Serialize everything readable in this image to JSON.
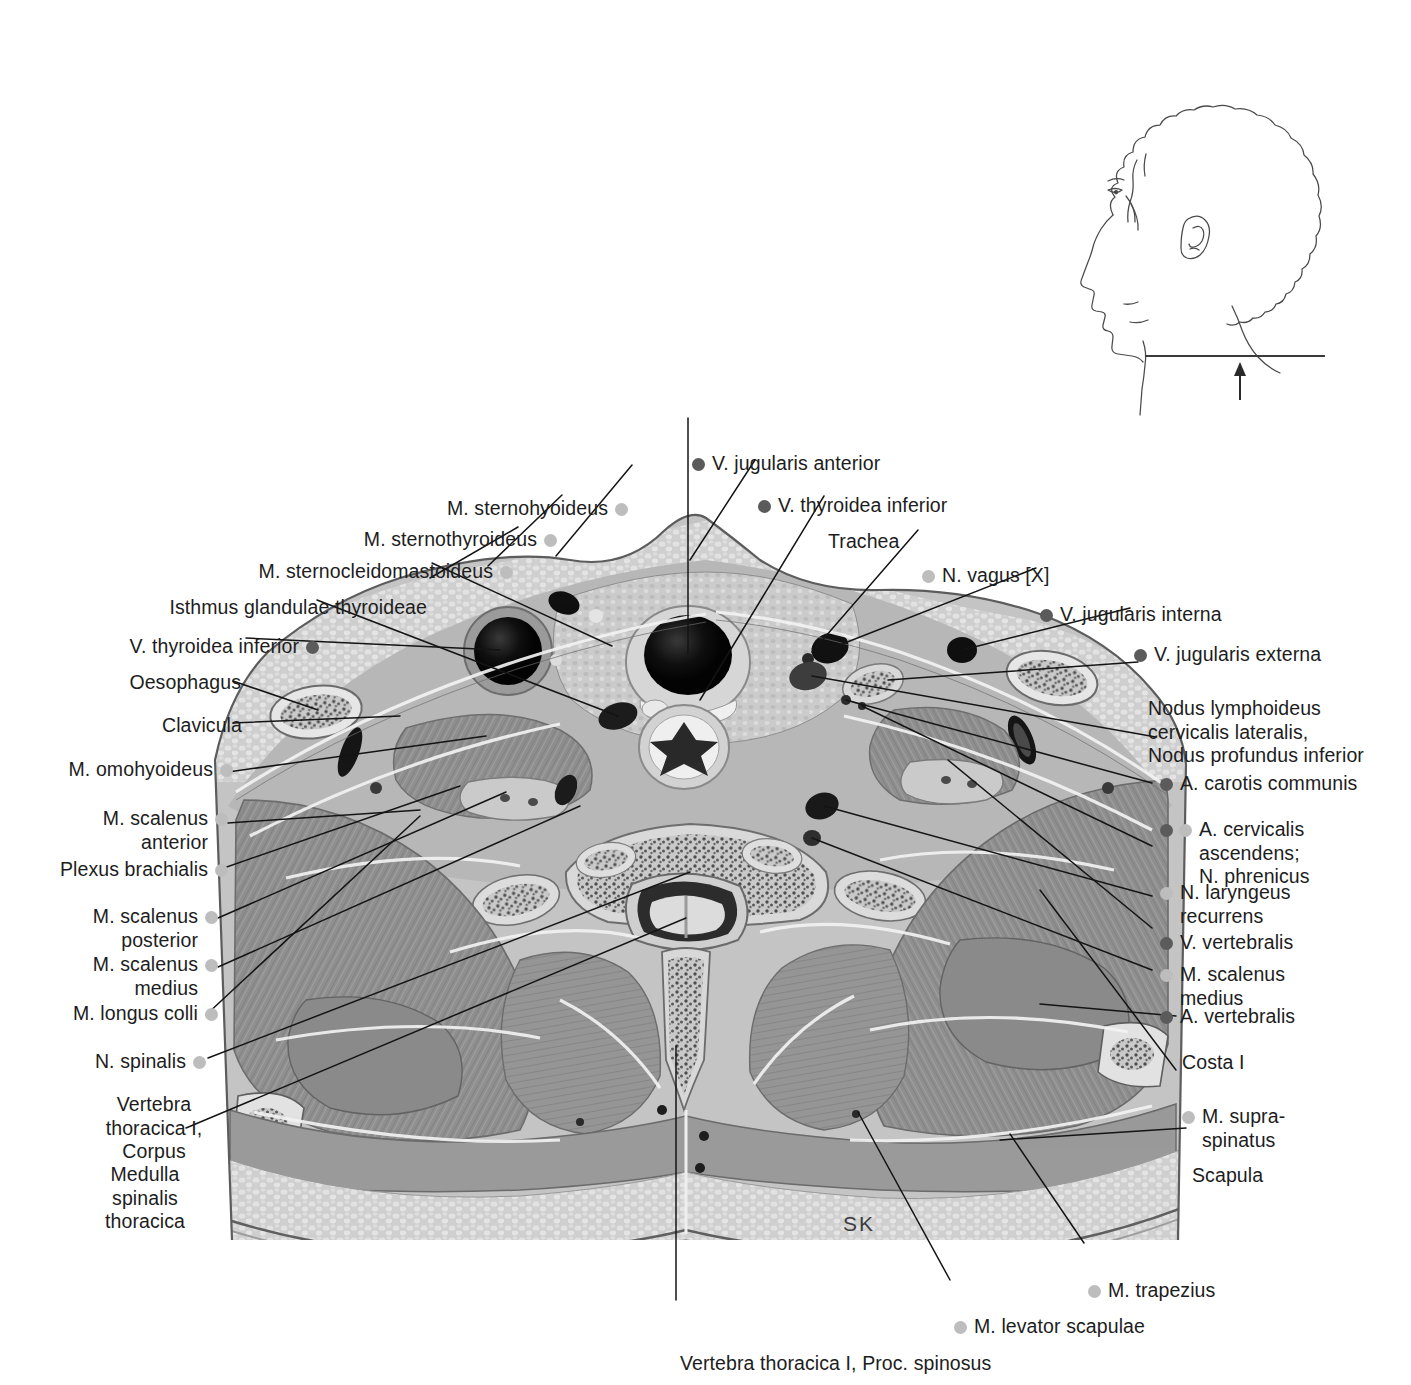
{
  "figure": {
    "type": "anatomical-cross-section",
    "region": "Neck / thoracic inlet, transverse section at vertebra thoracica I",
    "orientation_key": "SK",
    "orientation_label": "SK",
    "colors": {
      "vessel_dot": "#5b5b5b",
      "nerve_muscle_dot": "#bdbdbd",
      "leader_line": "#1a1a1a",
      "text": "#1d1d1d",
      "background": "#ffffff"
    }
  },
  "orientation_inset": {
    "name": "head-profile-inset",
    "description": "Lateral head and neck outline with horizontal section plane line and upward arrow"
  },
  "labels": {
    "top": [
      {
        "id": "v-jugularis-anterior",
        "text": "V. jugularis anterior",
        "dot": "dark",
        "dot_side": "left",
        "align": "left"
      },
      {
        "id": "v-thyroidea-inferior-top",
        "text": "V. thyroidea inferior",
        "dot": "dark",
        "dot_side": "left",
        "align": "left"
      },
      {
        "id": "trachea",
        "text": "Trachea",
        "dot": "none",
        "align": "left"
      },
      {
        "id": "m-sternohyoideus",
        "text": "M. sternohyoideus",
        "dot": "light",
        "dot_side": "right",
        "align": "right"
      },
      {
        "id": "m-sternothyroideus",
        "text": "M. sternothyroideus",
        "dot": "light",
        "dot_side": "right",
        "align": "right"
      },
      {
        "id": "m-sternocleidomastoideus",
        "text": "M. sternocleidomastoideus",
        "dot": "light",
        "dot_side": "right",
        "align": "right"
      },
      {
        "id": "n-vagus",
        "text": "N. vagus [X]",
        "dot": "light",
        "dot_side": "left",
        "align": "left"
      }
    ],
    "left": [
      {
        "id": "isthmus-glandulae-thyroideae",
        "text": "Isthmus glandulae thyroideae",
        "dot": "none",
        "align": "right"
      },
      {
        "id": "v-thyroidea-inferior-left",
        "text": "V. thyroidea inferior",
        "dot": "dark",
        "dot_side": "right",
        "align": "right"
      },
      {
        "id": "oesophagus",
        "text": "Oesophagus",
        "dot": "none",
        "align": "right"
      },
      {
        "id": "clavicula",
        "text": "Clavicula",
        "dot": "none",
        "align": "right"
      },
      {
        "id": "m-omohyoideus",
        "text": "M. omohyoideus",
        "dot": "light",
        "dot_side": "right",
        "align": "right"
      },
      {
        "id": "m-scalenus-anterior",
        "text": "M. scalenus\nanterior",
        "dot": "light",
        "dot_side": "right",
        "align": "right"
      },
      {
        "id": "plexus-brachialis",
        "text": "Plexus brachialis",
        "dot": "light",
        "dot_side": "right",
        "align": "right"
      },
      {
        "id": "m-scalenus-posterior",
        "text": "M. scalenus\nposterior",
        "dot": "light",
        "dot_side": "right",
        "align": "right"
      },
      {
        "id": "m-scalenus-medius-left",
        "text": "M. scalenus\nmedius",
        "dot": "light",
        "dot_side": "right",
        "align": "right"
      },
      {
        "id": "m-longus-colli",
        "text": "M. longus colli",
        "dot": "light",
        "dot_side": "right",
        "align": "right"
      },
      {
        "id": "n-spinalis",
        "text": "N. spinalis",
        "dot": "light",
        "dot_side": "right",
        "align": "right"
      },
      {
        "id": "vertebra-thoracica-i-corpus",
        "text": "Vertebra\nthoracica I,\nCorpus",
        "dot": "none",
        "align": "right"
      },
      {
        "id": "medulla-spinalis-thoracica",
        "text": "Medulla\nspinalis\nthoracica",
        "dot": "none",
        "align": "right"
      }
    ],
    "right": [
      {
        "id": "v-jugularis-interna",
        "text": "V. jugularis interna",
        "dot": "dark",
        "dot_side": "left",
        "align": "left"
      },
      {
        "id": "v-jugularis-externa",
        "text": "V. jugularis externa",
        "dot": "dark",
        "dot_side": "left",
        "align": "left"
      },
      {
        "id": "nodus-lymphoideus",
        "text": "Nodus lymphoideus\ncervicalis lateralis,\nNodus profundus inferior",
        "dot": "none",
        "align": "left"
      },
      {
        "id": "a-carotis-communis",
        "text": "A. carotis communis",
        "dot": "dark",
        "dot_side": "left",
        "align": "left"
      },
      {
        "id": "a-cervicalis-ascendens",
        "text": "A. cervicalis\nascendens;\nN. phrenicus",
        "dot": "dark-light",
        "dot_side": "left",
        "align": "left"
      },
      {
        "id": "n-laryngeus-recurrens",
        "text": "N. laryngeus\nrecurrens",
        "dot": "light",
        "dot_side": "left",
        "align": "left"
      },
      {
        "id": "v-vertebralis",
        "text": "V. vertebralis",
        "dot": "dark",
        "dot_side": "left",
        "align": "left"
      },
      {
        "id": "m-scalenus-medius-right",
        "text": "M. scalenus\nmedius",
        "dot": "light",
        "dot_side": "left",
        "align": "left"
      },
      {
        "id": "a-vertebralis",
        "text": "A. vertebralis",
        "dot": "dark",
        "dot_side": "left",
        "align": "left"
      },
      {
        "id": "costa-i",
        "text": "Costa I",
        "dot": "none",
        "align": "left"
      },
      {
        "id": "m-supraspinatus",
        "text": "M. supra-\nspinatus",
        "dot": "light",
        "dot_side": "left",
        "align": "left"
      },
      {
        "id": "scapula",
        "text": "Scapula",
        "dot": "none",
        "align": "left"
      }
    ],
    "bottom": [
      {
        "id": "m-trapezius",
        "text": "M. trapezius",
        "dot": "light",
        "dot_side": "left",
        "align": "left"
      },
      {
        "id": "m-levator-scapulae",
        "text": "M. levator scapulae",
        "dot": "light",
        "dot_side": "left",
        "align": "left"
      },
      {
        "id": "vertebra-thoracica-i-proc-spinosus",
        "text": "Vertebra thoracica I, Proc. spinosus",
        "dot": "none",
        "align": "left"
      }
    ]
  }
}
